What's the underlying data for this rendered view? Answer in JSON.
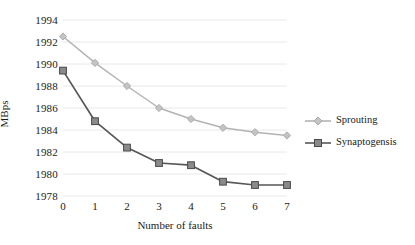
{
  "chart_data": {
    "type": "line",
    "title": "",
    "xlabel": "Number of faults",
    "ylabel": "MBps",
    "x": [
      0,
      1,
      2,
      3,
      4,
      5,
      6,
      7
    ],
    "xtick_labels": [
      "0",
      "1",
      "2",
      "3",
      "4",
      "5",
      "6",
      "7"
    ],
    "ytick_labels": [
      "1978",
      "1980",
      "1982",
      "1984",
      "1986",
      "1988",
      "1990",
      "1992",
      "1994"
    ],
    "yticks": [
      1978,
      1980,
      1982,
      1984,
      1986,
      1988,
      1990,
      1992,
      1994
    ],
    "xlim": [
      0,
      7
    ],
    "ylim": [
      1978,
      1994
    ],
    "grid": true,
    "grid_axis": "y",
    "legend_position": "right",
    "series": [
      {
        "name": "Sprouting",
        "color": "#b3b3b3",
        "marker": "diamond",
        "values": [
          1992.5,
          1990.1,
          1988.0,
          1986.0,
          1985.0,
          1984.2,
          1983.8,
          1983.5
        ]
      },
      {
        "name": "Synaptogensis",
        "color": "#575757",
        "marker": "square",
        "values": [
          1989.4,
          1984.8,
          1982.4,
          1981.0,
          1980.8,
          1979.3,
          1979.0,
          1979.0
        ]
      }
    ]
  },
  "legend": {
    "items": [
      {
        "label": "Sprouting"
      },
      {
        "label": "Synaptogensis"
      }
    ]
  },
  "colors": {
    "series_1": "#b3b3b3",
    "series_2": "#575757",
    "gridline": "#e8e8e8",
    "text": "#1a1a1a",
    "background": "#ffffff"
  }
}
